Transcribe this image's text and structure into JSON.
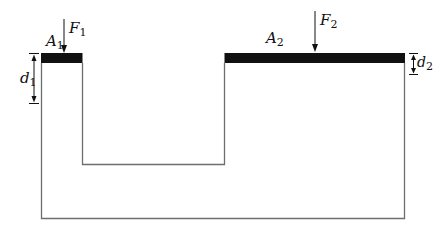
{
  "diagram": {
    "colors": {
      "background": "#ffffff",
      "line": "#6e6e6e",
      "piston": "#111111",
      "text": "#111111"
    },
    "pistons": [
      {
        "id": "piston-1",
        "area_label": "A",
        "area_sub": "1",
        "force_label": "F",
        "force_sub": "1",
        "displacement_label": "d",
        "displacement_sub": "1"
      },
      {
        "id": "piston-2",
        "area_label": "A",
        "area_sub": "2",
        "force_label": "F",
        "force_sub": "2",
        "displacement_label": "d",
        "displacement_sub": "2"
      }
    ]
  }
}
